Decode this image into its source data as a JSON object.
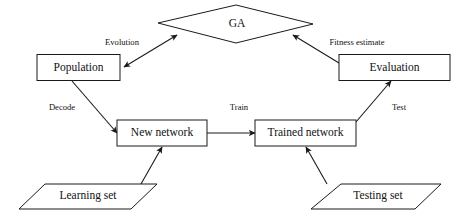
{
  "diagram": {
    "colors": {
      "background": "#ffffff",
      "stroke": "#1a1a1a",
      "text": "#111111",
      "shape_fill": "#ffffff"
    },
    "nodes": {
      "ga": {
        "label": "GA",
        "shape": "diamond"
      },
      "population": {
        "label": "Population",
        "shape": "rectangle"
      },
      "evaluation": {
        "label": "Evaluation",
        "shape": "rectangle"
      },
      "new_network": {
        "label": "New network",
        "shape": "rectangle"
      },
      "trained_network": {
        "label": "Trained network",
        "shape": "rectangle"
      },
      "learning_set": {
        "label": "Learning set",
        "shape": "parallelogram"
      },
      "testing_set": {
        "label": "Testing set",
        "shape": "parallelogram"
      }
    },
    "edges": {
      "evolution": {
        "label": "Evolution",
        "from": "ga",
        "to": "population",
        "arrows": "both"
      },
      "fitness_estimate": {
        "label": "Fitness estimate",
        "from": "evaluation",
        "to": "ga",
        "arrows": "to"
      },
      "decode": {
        "label": "Decode",
        "from": "population",
        "to": "new_network",
        "arrows": "to"
      },
      "train": {
        "label": "Train",
        "from": "new_network",
        "to": "trained_network",
        "arrows": "to"
      },
      "test": {
        "label": "Test",
        "from": "trained_network",
        "to": "evaluation",
        "arrows": "to"
      },
      "learning_feed": {
        "label": "",
        "from": "learning_set",
        "to": "new_network",
        "arrows": "to"
      },
      "testing_feed": {
        "label": "",
        "from": "testing_set",
        "to": "trained_network",
        "arrows": "to"
      }
    }
  }
}
